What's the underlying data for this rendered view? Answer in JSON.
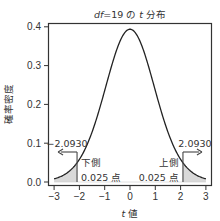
{
  "chart_data": {
    "type": "line",
    "title": "df=19 の t 分布",
    "title_parts": {
      "italic": "df",
      "middle": "=19 の ",
      "italic2": "t",
      "end": " 分布"
    },
    "xlabel": "t 値",
    "xlabel_parts": {
      "italic": "t",
      "rest": " 値"
    },
    "ylabel": "確率密度",
    "xlim": [
      -3.3,
      3.3
    ],
    "ylim": [
      -0.01,
      0.41
    ],
    "xticks": [
      -3,
      -2,
      -1,
      0,
      1,
      2,
      3
    ],
    "xtick_labels": [
      "−3",
      "−2",
      "−1",
      "0",
      "1",
      "2",
      "3"
    ],
    "yticks": [
      0.0,
      0.1,
      0.2,
      0.3,
      0.4
    ],
    "ytick_labels": [
      "0.0",
      "0.1",
      "0.2",
      "0.3",
      "0.4"
    ],
    "grid": false,
    "distribution": {
      "name": "Student t",
      "df": 19,
      "x_range": [
        -3,
        3
      ]
    },
    "critical_value": 2.093,
    "shaded_regions": [
      {
        "name": "lower-tail",
        "from": -3,
        "to": -2.093,
        "area_label": "0.025"
      },
      {
        "name": "upper-tail",
        "from": 2.093,
        "to": 3,
        "area_label": "0.025"
      }
    ],
    "annotations": [
      {
        "name": "lower-critical-value",
        "text": "−2.0930",
        "x": -2.093,
        "arrow": "left"
      },
      {
        "name": "upper-critical-value",
        "text": "2.0930",
        "x": 2.093,
        "arrow": "right"
      },
      {
        "name": "lower-tail-label",
        "line1": "下側",
        "line2": "0.025 点"
      },
      {
        "name": "upper-tail-label",
        "line1": "上側",
        "line2": "0.025 点"
      }
    ],
    "colors": {
      "curve": "#222222",
      "shade": "#d9d9d9",
      "axis": "#333333"
    }
  }
}
